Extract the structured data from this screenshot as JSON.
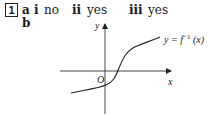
{
  "question": {
    "number": "1",
    "part_a": {
      "label": "a",
      "answers": [
        {
          "roman": "i",
          "value": "no"
        },
        {
          "roman": "ii",
          "value": "yes"
        },
        {
          "roman": "iii",
          "value": "yes"
        }
      ]
    },
    "part_b": {
      "label": "b"
    }
  },
  "graph": {
    "y_axis_label": "y",
    "x_axis_label": "x",
    "origin_label": "O",
    "curve_label": "y = f⁻¹ (x)",
    "curve_label_prefix": "y = f",
    "curve_label_sup": "−1",
    "curve_label_suffix": " (x)"
  }
}
